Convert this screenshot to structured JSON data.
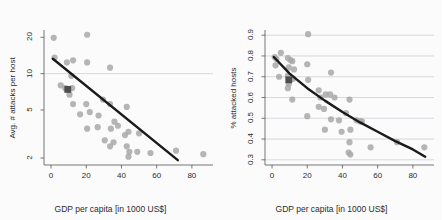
{
  "figure": {
    "background_color": "#fbfbfb",
    "page_color": "#ffffff",
    "point_color": "#a8a8a8",
    "highlight_color": "#4d4d4d",
    "fit_line_color": "#1a1a1a",
    "grid_color": "#c8c8d2",
    "axis_color": "#555555",
    "text_color": "#2b2b2b"
  },
  "chart_data": [
    {
      "type": "scatter",
      "panel": "left",
      "title": "2011",
      "xlabel": "GDP per capita [in 1000 US$]",
      "ylabel": "Avg. # attacks per host",
      "xlim": [
        -4,
        92
      ],
      "ylim": [
        1.75,
        23
      ],
      "yscale": "log",
      "xticks": [
        0,
        20,
        40,
        60,
        80
      ],
      "xtick_labels": [
        "0",
        "20",
        "40",
        "60",
        "80"
      ],
      "yticks": [
        2,
        5,
        10,
        20
      ],
      "ytick_labels": [
        "2",
        "5",
        "10",
        "20"
      ],
      "grid": "horizontal-at-10",
      "gridlines_y": [
        10
      ],
      "legend": "none",
      "points": [
        {
          "x": 1.5,
          "y": 19.8
        },
        {
          "x": 20.5,
          "y": 21.0
        },
        {
          "x": 2.0,
          "y": 13.6
        },
        {
          "x": 9.0,
          "y": 12.4
        },
        {
          "x": 12.5,
          "y": 12.9
        },
        {
          "x": 20.5,
          "y": 12.4
        },
        {
          "x": 33.5,
          "y": 11.2
        },
        {
          "x": 11.5,
          "y": 9.6
        },
        {
          "x": 5.5,
          "y": 8.0
        },
        {
          "x": 8.0,
          "y": 7.6
        },
        {
          "x": 12.0,
          "y": 7.6
        },
        {
          "x": 10.5,
          "y": 6.7
        },
        {
          "x": 12.5,
          "y": 5.6
        },
        {
          "x": 20.0,
          "y": 5.6
        },
        {
          "x": 29.5,
          "y": 6.1
        },
        {
          "x": 33.5,
          "y": 5.6
        },
        {
          "x": 43.0,
          "y": 5.3
        },
        {
          "x": 16.5,
          "y": 4.6
        },
        {
          "x": 22.0,
          "y": 4.8
        },
        {
          "x": 27.0,
          "y": 4.5
        },
        {
          "x": 36.0,
          "y": 4.0
        },
        {
          "x": 20.5,
          "y": 3.5
        },
        {
          "x": 26.5,
          "y": 3.6
        },
        {
          "x": 34.0,
          "y": 3.5
        },
        {
          "x": 38.0,
          "y": 3.7
        },
        {
          "x": 30.5,
          "y": 2.8
        },
        {
          "x": 35.5,
          "y": 2.7
        },
        {
          "x": 42.0,
          "y": 3.1
        },
        {
          "x": 44.0,
          "y": 3.3
        },
        {
          "x": 50.0,
          "y": 3.2
        },
        {
          "x": 33.5,
          "y": 2.5
        },
        {
          "x": 43.0,
          "y": 2.5
        },
        {
          "x": 44.5,
          "y": 2.25
        },
        {
          "x": 49.0,
          "y": 2.25
        },
        {
          "x": 56.5,
          "y": 2.2
        },
        {
          "x": 44.0,
          "y": 2.05
        },
        {
          "x": 71.0,
          "y": 2.3
        },
        {
          "x": 86.5,
          "y": 2.15
        }
      ],
      "highlight_point": {
        "x": 9.5,
        "y": 7.4,
        "marker": "square"
      },
      "fit_line": {
        "x0": 1.0,
        "y0": 13.3,
        "x1": 72.0,
        "y1": 1.92,
        "kind": "linear-on-log"
      }
    },
    {
      "type": "scatter",
      "panel": "right",
      "title": "2011",
      "xlabel": "GDP per capita [in 1000 US$]",
      "ylabel": "% attacked hosts",
      "xlim": [
        -4,
        92
      ],
      "ylim": [
        0.275,
        0.925
      ],
      "yscale": "linear",
      "xticks": [
        0,
        20,
        40,
        60,
        80
      ],
      "xtick_labels": [
        "0",
        "20",
        "40",
        "60",
        "80"
      ],
      "yticks": [
        0.3,
        0.4,
        0.5,
        0.6,
        0.7,
        0.8,
        0.9
      ],
      "ytick_labels": [
        "0.3",
        "0.4",
        "0.5",
        "0.6",
        "0.7",
        "0.8",
        "0.9"
      ],
      "grid": "horizontal",
      "gridlines_y": [
        0.3,
        0.4,
        0.5,
        0.6,
        0.7,
        0.8,
        0.9
      ],
      "legend": "none",
      "points": [
        {
          "x": 20.5,
          "y": 0.905
        },
        {
          "x": 1.5,
          "y": 0.795
        },
        {
          "x": 2.5,
          "y": 0.785
        },
        {
          "x": 5.0,
          "y": 0.815
        },
        {
          "x": 9.0,
          "y": 0.79
        },
        {
          "x": 10.5,
          "y": 0.78
        },
        {
          "x": 11.5,
          "y": 0.775
        },
        {
          "x": 2.0,
          "y": 0.755
        },
        {
          "x": 9.5,
          "y": 0.745
        },
        {
          "x": 20.0,
          "y": 0.76
        },
        {
          "x": 12.5,
          "y": 0.735
        },
        {
          "x": 33.5,
          "y": 0.72
        },
        {
          "x": 4.0,
          "y": 0.7
        },
        {
          "x": 9.0,
          "y": 0.705
        },
        {
          "x": 12.0,
          "y": 0.69
        },
        {
          "x": 20.5,
          "y": 0.685
        },
        {
          "x": 9.5,
          "y": 0.665
        },
        {
          "x": 9.0,
          "y": 0.645
        },
        {
          "x": 26.5,
          "y": 0.635
        },
        {
          "x": 30.5,
          "y": 0.615
        },
        {
          "x": 33.0,
          "y": 0.615
        },
        {
          "x": 35.5,
          "y": 0.6
        },
        {
          "x": 27.5,
          "y": 0.6
        },
        {
          "x": 11.5,
          "y": 0.59
        },
        {
          "x": 44.0,
          "y": 0.59
        },
        {
          "x": 26.5,
          "y": 0.555
        },
        {
          "x": 29.5,
          "y": 0.545
        },
        {
          "x": 42.0,
          "y": 0.525
        },
        {
          "x": 20.0,
          "y": 0.51
        },
        {
          "x": 33.5,
          "y": 0.495
        },
        {
          "x": 38.0,
          "y": 0.49
        },
        {
          "x": 48.0,
          "y": 0.49
        },
        {
          "x": 50.0,
          "y": 0.485
        },
        {
          "x": 51.0,
          "y": 0.485
        },
        {
          "x": 30.0,
          "y": 0.445
        },
        {
          "x": 39.5,
          "y": 0.435
        },
        {
          "x": 44.5,
          "y": 0.445
        },
        {
          "x": 44.0,
          "y": 0.385
        },
        {
          "x": 56.0,
          "y": 0.36
        },
        {
          "x": 71.0,
          "y": 0.385
        },
        {
          "x": 86.5,
          "y": 0.36
        },
        {
          "x": 43.5,
          "y": 0.335
        },
        {
          "x": 44.5,
          "y": 0.325
        }
      ],
      "highlight_point": {
        "x": 9.5,
        "y": 0.685,
        "marker": "square"
      },
      "fit_line": {
        "kind": "curve-decay",
        "points": [
          {
            "x": 1.0,
            "y": 0.795
          },
          {
            "x": 10.0,
            "y": 0.715
          },
          {
            "x": 20.0,
            "y": 0.645
          },
          {
            "x": 30.0,
            "y": 0.585
          },
          {
            "x": 40.0,
            "y": 0.53
          },
          {
            "x": 50.0,
            "y": 0.48
          },
          {
            "x": 60.0,
            "y": 0.435
          },
          {
            "x": 70.0,
            "y": 0.39
          },
          {
            "x": 80.0,
            "y": 0.35
          },
          {
            "x": 87.0,
            "y": 0.315
          }
        ]
      }
    }
  ]
}
